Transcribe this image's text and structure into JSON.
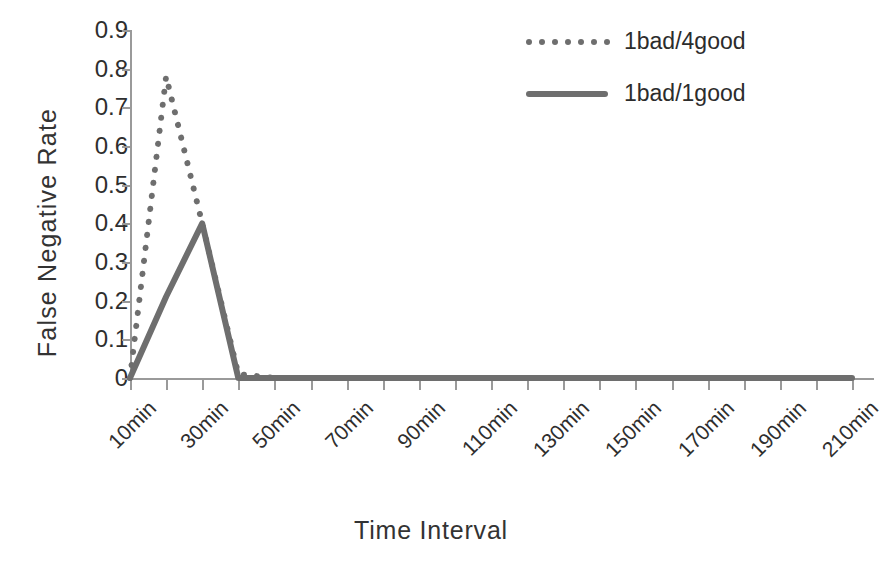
{
  "chart_data": {
    "type": "line",
    "title": "",
    "xlabel": "Time Interval",
    "ylabel": "False Negative Rate",
    "ylim": [
      0,
      0.9
    ],
    "ytick_values": [
      0,
      0.1,
      0.2,
      0.3,
      0.4,
      0.5,
      0.6,
      0.7,
      0.8,
      0.9
    ],
    "ytick_labels": [
      "0",
      "0.1",
      "0.2",
      "0.3",
      "0.4",
      "0.5",
      "0.6",
      "0.7",
      "0.8",
      "0.9"
    ],
    "grid": false,
    "legend_position": "top-right",
    "x": [
      10,
      20,
      30,
      40,
      50,
      60,
      70,
      80,
      90,
      100,
      110,
      120,
      130,
      140,
      150,
      160,
      170,
      180,
      190,
      200,
      210
    ],
    "xtick_labels": [
      "10min",
      "30min",
      "50min",
      "70min",
      "90min",
      "110min",
      "130min",
      "150min",
      "170min",
      "190min",
      "210min"
    ],
    "xtick_label_values": [
      10,
      30,
      50,
      70,
      90,
      110,
      130,
      150,
      170,
      190,
      210
    ],
    "xtick_label_rotation": -45,
    "minor_tick_interval": 10,
    "series": [
      {
        "name": "1bad/4good",
        "style": "dotted",
        "color": "#6e6e6e",
        "values": [
          0.0,
          0.78,
          0.4,
          0.01,
          0.0,
          0.0,
          0.0,
          0.0,
          0.0,
          0.0,
          0.0,
          0.0,
          0.0,
          0.0,
          0.0,
          0.0,
          0.0,
          0.0,
          0.0,
          0.0,
          0.0
        ]
      },
      {
        "name": "1bad/1good",
        "style": "solid",
        "color": "#6e6e6e",
        "values": [
          0.0,
          0.21,
          0.4,
          0.0,
          0.0,
          0.0,
          0.0,
          0.0,
          0.0,
          0.0,
          0.0,
          0.0,
          0.0,
          0.0,
          0.0,
          0.0,
          0.0,
          0.0,
          0.0,
          0.0,
          0.0
        ]
      }
    ],
    "annotations": []
  },
  "legend": {
    "items": [
      {
        "label": "1bad/4good",
        "style": "dotted"
      },
      {
        "label": "1bad/1good",
        "style": "solid"
      }
    ]
  },
  "colors": {
    "series": "#6e6e6e",
    "axis": "#9a9a9a",
    "text": "#2e2e2e",
    "background": "#ffffff"
  }
}
